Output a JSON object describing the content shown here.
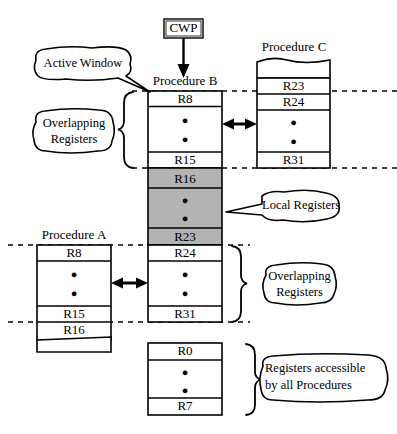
{
  "diagram": {
    "title_cwp": "CWP",
    "columns": {
      "procedure_a": {
        "title": "Procedure A",
        "rows": [
          "R8",
          "●",
          "●",
          "R15",
          "R16"
        ]
      },
      "procedure_b": {
        "title": "Procedure B",
        "overlap_top_rows": [
          "R8",
          "●",
          "●",
          "R15"
        ],
        "local_rows": [
          "R16",
          "●",
          "●",
          "R23"
        ],
        "overlap_bottom_rows": [
          "R24",
          "●",
          "●",
          "R31"
        ]
      },
      "procedure_c": {
        "title": "Procedure C",
        "rows": [
          "R23",
          "R24",
          "●",
          "●",
          "R31"
        ]
      },
      "global": {
        "rows": [
          "R0",
          "●",
          "●",
          "R7"
        ]
      }
    },
    "callouts": {
      "active_window": "Active Window",
      "overlapping_registers_top_line1": "Overlapping",
      "overlapping_registers_top_line2": "Registers",
      "local_registers": "Local Registers",
      "overlapping_registers_bottom_line1": "Overlapping",
      "overlapping_registers_bottom_line2": "Registers",
      "global_registers_line1": "Registers accessible",
      "global_registers_line2": "by all Procedures"
    },
    "colors": {
      "stroke": "#000000",
      "local_fill": "#b3b3b3",
      "background": "#ffffff"
    }
  }
}
